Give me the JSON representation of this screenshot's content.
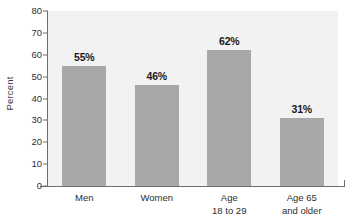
{
  "chart_data": {
    "type": "bar",
    "title": "",
    "subtitle": "",
    "xlabel": "",
    "ylabel": "Percent",
    "ylim": [
      0,
      80
    ],
    "ytick_step": 10,
    "yticks": [
      "80",
      "70",
      "60",
      "50",
      "40",
      "30",
      "20",
      "10",
      "0"
    ],
    "grid": false,
    "legend": false,
    "legend_position": "none",
    "categories": [
      "Men",
      "Women",
      "Age 18 to 29",
      "Age 65 and older"
    ],
    "category_lines": [
      [
        "Men",
        ""
      ],
      [
        "Women",
        ""
      ],
      [
        "Age",
        "18 to 29"
      ],
      [
        "Age 65",
        "and older"
      ]
    ],
    "values": [
      55,
      46,
      62,
      31
    ],
    "value_labels": [
      "55%",
      "46%",
      "62%",
      "31%"
    ],
    "colors": {
      "bar_fill": "#a8a8a8",
      "plot_background": "#f2f2f2",
      "axis": "#6e6e6e",
      "text": "#2e2e2e",
      "value_label_text": "#1a1a1a",
      "page_background": "#ffffff"
    }
  }
}
